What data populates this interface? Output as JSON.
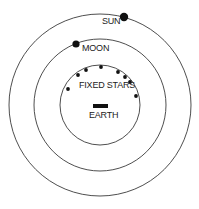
{
  "diagram": {
    "type": "geocentric-model",
    "center": [
      100,
      105
    ],
    "orbits": [
      {
        "name": "sun-orbit",
        "radius": 91
      },
      {
        "name": "moon-orbit",
        "radius": 66
      },
      {
        "name": "fixed-stars-sphere",
        "radius": 40
      }
    ],
    "labels": {
      "sun": "SUN",
      "moon": "MOON",
      "fixed_stars": "FIXED STARS",
      "earth": "EARTH"
    },
    "bodies": {
      "sun": {
        "x": 124,
        "y": 17,
        "r": 4.2
      },
      "moon": {
        "x": 76,
        "y": 44,
        "r": 3.6
      }
    },
    "stars": [
      {
        "x": 68,
        "y": 89
      },
      {
        "x": 78,
        "y": 75
      },
      {
        "x": 86,
        "y": 70
      },
      {
        "x": 101,
        "y": 67
      },
      {
        "x": 118,
        "y": 72
      },
      {
        "x": 125,
        "y": 77
      },
      {
        "x": 130,
        "y": 82
      },
      {
        "x": 136,
        "y": 96
      }
    ],
    "earth_symbol": {
      "x": 93,
      "y": 104,
      "w": 15,
      "h": 4
    },
    "colors": {
      "stroke": "#3a3a3a",
      "fill": "#111111",
      "background": "#ffffff"
    }
  }
}
